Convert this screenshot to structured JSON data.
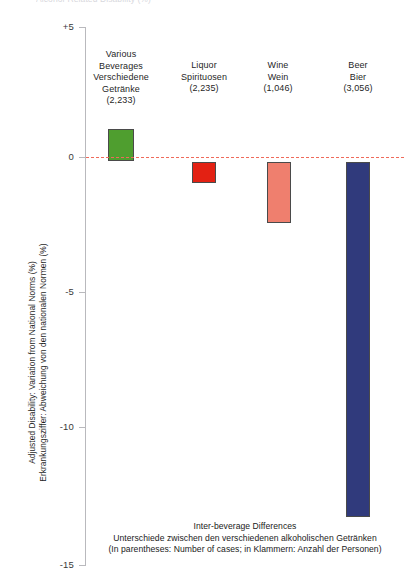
{
  "clipped_top_title": "Alcohol-Related Disability (%)",
  "chart_data": {
    "type": "bar",
    "title": "Inter-beverage Differences",
    "subtitle": "Unterschiede zwischen den verschiedenen alkoholischen Getränken",
    "note": "(In parentheses: Number of cases; in Klammern: Anzahl der Personen)",
    "xlabel": "",
    "ylabel": "Adjusted Disability: Variation from National Norms (%)",
    "ylabel_de": "Erkrankungsziffer: Abweichung von den nationalen Normen (%)",
    "ylim": [
      -15,
      5
    ],
    "yticks": [
      "+5",
      "0",
      "-5",
      "-10",
      "-15"
    ],
    "ytick_values": [
      5,
      0,
      -5,
      -10,
      -15
    ],
    "grid": false,
    "legend": "none",
    "zero_reference_line": true,
    "zero_line_color": "#ef6a5a",
    "categories": [
      {
        "label_en": "Various Beverages",
        "label_en_line1": "Various",
        "label_en_line2": "Beverages",
        "label_de_line1": "Verschiedene",
        "label_de_line2": "Getränke",
        "count": "(2,233)",
        "value": 1.2,
        "color": "#4f9e2f"
      },
      {
        "label_en": "Liquor",
        "label_en_line1": "Liquor",
        "label_en_line2": "",
        "label_de_line1": "Spirituosen",
        "label_de_line2": "",
        "count": "(2,235)",
        "value": -0.8,
        "color": "#e32113"
      },
      {
        "label_en": "Wine",
        "label_en_line1": "Wine",
        "label_en_line2": "",
        "label_de_line1": "Wein",
        "label_de_line2": "",
        "count": "(1,046)",
        "value": -2.3,
        "color": "#ef7f6e"
      },
      {
        "label_en": "Beer",
        "label_en_line1": "Beer",
        "label_en_line2": "",
        "label_de_line1": "Bier",
        "label_de_line2": "",
        "count": "(3,056)",
        "value": -13.2,
        "color": "#303a7c"
      }
    ]
  },
  "axis": {
    "tick_0": "+5",
    "tick_1": "0",
    "tick_2": "-5",
    "tick_3": "-10",
    "tick_4": "-15"
  },
  "ytitle": {
    "line_en": "Adjusted Disability: Variation from National Norms (%)",
    "line_de": "Erkrankungsziffer: Abweichung von den nationalen Normen (%)"
  },
  "caption": {
    "line1": "Inter-beverage Differences",
    "line2": "Unterschiede zwischen den verschiedenen alkoholischen Getränken",
    "line3": "(In parentheses: Number of cases; in Klammern: Anzahl der Personen)"
  },
  "cat_labels": {
    "c0_l1": "Various",
    "c0_l2": "Beverages",
    "c0_l3": "Verschiedene",
    "c0_l4": "Getränke",
    "c0_l5": "(2,233)",
    "c1_l1": "Liquor",
    "c1_l2": "Spirituosen",
    "c1_l3": "(2,235)",
    "c2_l1": "Wine",
    "c2_l2": "Wein",
    "c2_l3": "(1,046)",
    "c3_l1": "Beer",
    "c3_l2": "Bier",
    "c3_l3": "(3,056)"
  }
}
